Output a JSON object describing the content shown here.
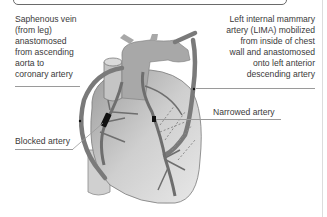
{
  "diagram": {
    "labels": {
      "saphenous_vein": "Saphenous vein\n(from leg)\nanastomosed\nfrom ascending\naorta to\ncoronary artery",
      "lima": "Left internal mammary\nartery (LIMA) mobilized\nfrom inside of chest\nwall and anastomosed\nonto left anterior\ndescending artery",
      "narrowed_artery": "Narrowed artery",
      "blocked_artery": "Blocked artery"
    },
    "colors": {
      "text": "#3a3a3a",
      "heart_fill": "#c9c9c9",
      "aorta_fill": "#a8a8a8",
      "vessel_stroke": "#6e6e6e",
      "graft_stroke": "#7a7a7a",
      "blockage": "#111111",
      "leader_line": "#9a9a9a"
    }
  }
}
